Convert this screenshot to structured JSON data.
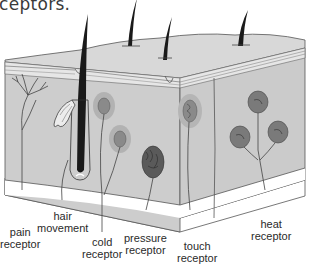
{
  "caption_fragment": "ceptors.",
  "diagram": {
    "colors": {
      "skin_fill": "#cfcfcf",
      "skin_top": "#dcdcdc",
      "epidermis_band": "#e8e8e8",
      "hair": "#1a1a1a",
      "receptor_outer": "#b0b0b0",
      "receptor_inner": "#8a8a8a",
      "pressure_receptor": "#5a5a5a",
      "heat_receptor": "#7a7a7a",
      "outline": "#444444"
    },
    "labels": [
      {
        "id": "pain",
        "line1": "pain",
        "line2": "receptor"
      },
      {
        "id": "hair",
        "line1": "hair",
        "line2": "movement"
      },
      {
        "id": "cold",
        "line1": "cold",
        "line2": "receptor"
      },
      {
        "id": "pressure",
        "line1": "pressure",
        "line2": "receptor"
      },
      {
        "id": "touch",
        "line1": "touch",
        "line2": "receptor"
      },
      {
        "id": "heat",
        "line1": "heat",
        "line2": "receptor"
      }
    ]
  }
}
